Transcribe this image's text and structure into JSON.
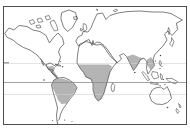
{
  "figure": {
    "type": "world-map-outline",
    "colors": {
      "background": "#ffffff",
      "frame": "#4d4d4d",
      "land_outline": "#474747",
      "land_fill": "#ffffff",
      "shaded_region": "#b4b4b4",
      "equator_line": "#8a8a8a",
      "tropic_line": "#d2d2d2",
      "island_dot": "#474747"
    },
    "shaded_regions": [
      {
        "name": "central-america"
      },
      {
        "name": "tropical-south-america"
      },
      {
        "name": "sub-saharan-africa"
      },
      {
        "name": "indian-subcontinent"
      },
      {
        "name": "indochina-southeast-asia"
      }
    ],
    "reference_lines": [
      {
        "name": "tropic-of-cancer"
      },
      {
        "name": "equator"
      },
      {
        "name": "tropic-of-capricorn"
      }
    ]
  }
}
